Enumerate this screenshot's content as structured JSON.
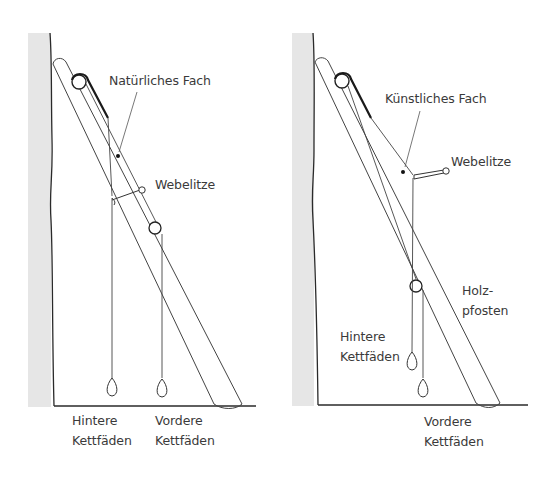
{
  "panels": [
    {
      "id": "left",
      "title": "Natural shed",
      "labels": {
        "shed": "Natürliches Fach",
        "heddle": "Webelitze",
        "back_threads_line1": "Hintere",
        "back_threads_line2": "Kettfäden",
        "front_threads_line1": "Vordere",
        "front_threads_line2": "Kettfäden"
      }
    },
    {
      "id": "right",
      "title": "Artificial shed",
      "labels": {
        "shed": "Künstliches Fach",
        "heddle": "Webelitze",
        "post_line1": "Holz-",
        "post_line2": "pfosten",
        "back_threads_line1": "Hintere",
        "back_threads_line2": "Kettfäden",
        "front_threads_line1": "Vordere",
        "front_threads_line2": "Kettfäden"
      }
    }
  ],
  "colors": {
    "line": "#2a2a2a",
    "thin_line": "#555555",
    "wall": "#e6e6e6",
    "text": "#3a3a3a"
  }
}
